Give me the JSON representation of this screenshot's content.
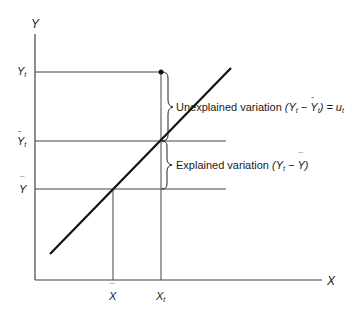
{
  "diagram": {
    "type": "regression-variation-decomposition",
    "axes": {
      "y_label": "Y",
      "x_label": "X"
    },
    "y_ticks": [
      {
        "base": "Y",
        "accent": "",
        "sub": "t",
        "y": 72
      },
      {
        "base": "Y",
        "accent": "hat",
        "sub": "t",
        "y": 141
      },
      {
        "base": "Y",
        "accent": "bar",
        "sub": "",
        "y": 189
      }
    ],
    "x_ticks": [
      {
        "base": "X",
        "accent": "bar",
        "sub": "",
        "x": 113
      },
      {
        "base": "X",
        "accent": "",
        "sub": "t",
        "x": 161
      }
    ],
    "annotations": {
      "unexplained": {
        "prefix": "Unexplained variation",
        "formula": "(Y",
        "sub1": "t",
        "minus": " − ",
        "yhat": "Y",
        "sub2": "t",
        "close": ") = u",
        "sub3": "t"
      },
      "explained": {
        "prefix": "Explained variation",
        "formula": "(Y",
        "sub1": "t",
        "minus": " − ",
        "ybar": "Y",
        "close": ")"
      }
    },
    "colors": {
      "ink": "#1a1a1a",
      "axis": "#444444"
    }
  }
}
